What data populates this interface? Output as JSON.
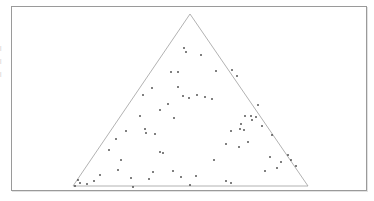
{
  "figure": {
    "name": "ternary-scatter-plot",
    "background_color": "#ffffff",
    "frame_color": "#9a9a9a",
    "triangle_color": "#9e9e9e",
    "point_color": "#3a3a3a"
  },
  "margin_text": {
    "line1": "|",
    "line2": "|",
    "line3": "|"
  },
  "chart_data": {
    "type": "scatter",
    "title": "",
    "subtitle": "",
    "xlabel": "",
    "ylabel": "",
    "grid": false,
    "legend": null,
    "axis_visible": false,
    "tick_labels": [],
    "annotations": [],
    "plot_shape": "triangle",
    "xlim": [
      0,
      374
    ],
    "ylim": [
      201,
      0
    ],
    "triangle": {
      "apex": [
        190,
        14
      ],
      "bottom_left": [
        73,
        186
      ],
      "bottom_right": [
        308,
        186
      ],
      "stroke": "#9e9e9e",
      "stroke_width": 0.8,
      "fill": "none"
    },
    "frame": {
      "x": 11,
      "y": 6,
      "width": 356,
      "height": 185,
      "stroke": "#9a9a9a"
    },
    "marker": {
      "shape": "square",
      "size": 1.6,
      "color": "#3a3a3a"
    },
    "n_points": 68,
    "x": [
      184,
      186,
      201,
      171,
      178,
      216,
      152,
      143,
      178,
      183,
      189,
      232,
      237,
      245,
      251,
      256,
      241,
      244,
      240,
      262,
      231,
      248,
      226,
      270,
      281,
      288,
      126,
      116,
      145,
      146,
      155,
      160,
      163,
      118,
      153,
      173,
      78,
      80,
      75,
      133,
      190,
      226,
      231,
      205,
      168,
      197,
      212,
      174,
      160,
      140,
      109,
      121,
      252,
      239,
      291,
      296,
      277,
      265,
      214,
      196,
      181,
      149,
      131,
      100,
      94,
      87,
      258,
      272
    ],
    "y": [
      48,
      52,
      55,
      72,
      72,
      71,
      88,
      95,
      87,
      96,
      98,
      70,
      76,
      116,
      116,
      117,
      124,
      130,
      129,
      126,
      131,
      142,
      144,
      157,
      162,
      155,
      131,
      139,
      129,
      133,
      134,
      152,
      153,
      170,
      172,
      171,
      180,
      183,
      186,
      187,
      185,
      181,
      183,
      97,
      104,
      95,
      99,
      118,
      110,
      116,
      150,
      160,
      120,
      147,
      160,
      166,
      168,
      171,
      160,
      176,
      177,
      179,
      178,
      175,
      181,
      184,
      105,
      135
    ]
  }
}
